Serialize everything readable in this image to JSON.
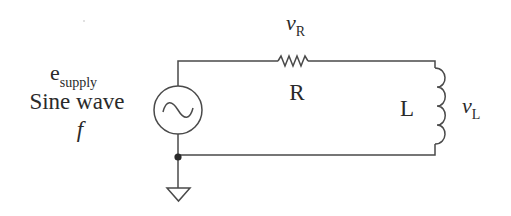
{
  "source": {
    "label_main": "e",
    "label_sub": "supply",
    "type_label": "Sine wave",
    "freq_label": "f"
  },
  "resistor": {
    "name": "R",
    "voltage_main": "v",
    "voltage_sub": "R"
  },
  "inductor": {
    "name": "L",
    "voltage_main": "v",
    "voltage_sub": "L"
  },
  "colors": {
    "wire": "#4a4a4a",
    "text": "#2a2a2a",
    "background": "#ffffff"
  }
}
